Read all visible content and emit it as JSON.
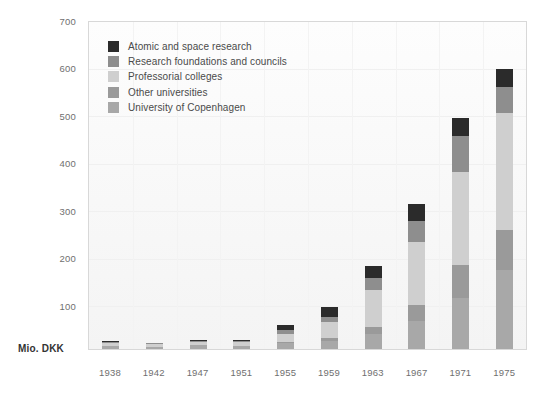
{
  "chart_data": {
    "type": "bar",
    "subtype": "stacked-bar",
    "title": "",
    "subtitle": "",
    "xlabel": "",
    "ylabel": "Mio. DKK",
    "ylim": [
      0,
      700
    ],
    "ytick_values": [
      100,
      200,
      300,
      400,
      500,
      600,
      700
    ],
    "ytick_labels": [
      "100",
      "200",
      "300",
      "400",
      "500",
      "600",
      "700"
    ],
    "grid": true,
    "legend_position": "inside-top-left",
    "categories": [
      "1938",
      "1942",
      "1947",
      "1951",
      "1955",
      "1959",
      "1963",
      "1967",
      "1971",
      "1975"
    ],
    "series": [
      {
        "name": "University of Copenhagen",
        "color": "#a8a8a8",
        "values": [
          7,
          5,
          8,
          7,
          12,
          18,
          33,
          60,
          110,
          170
        ]
      },
      {
        "name": "Other universities",
        "color": "#9a9a9a",
        "values": [
          0,
          0,
          0,
          0,
          4,
          6,
          14,
          35,
          70,
          85
        ]
      },
      {
        "name": "Professorial colleges",
        "color": "#cfcfcf",
        "values": [
          6,
          5,
          7,
          7,
          17,
          33,
          80,
          135,
          200,
          250
        ]
      },
      {
        "name": "Research foundations and councils",
        "color": "#8e8e8e",
        "values": [
          3,
          2,
          3,
          3,
          7,
          12,
          25,
          45,
          75,
          55
        ]
      },
      {
        "name": "Atomic and space research",
        "color": "#2b2b2b",
        "values": [
          2,
          1,
          2,
          2,
          12,
          22,
          25,
          35,
          40,
          40
        ]
      }
    ],
    "totals": [
      18,
      13,
      20,
      19,
      52,
      91,
      177,
      310,
      495,
      600
    ]
  },
  "legend": {
    "items": [
      {
        "label": "Atomic and space research",
        "color": "#2b2b2b"
      },
      {
        "label": "Research foundations and councils",
        "color": "#8e8e8e"
      },
      {
        "label": "Professorial colleges",
        "color": "#cfcfcf"
      },
      {
        "label": "Other universities",
        "color": "#9a9a9a"
      },
      {
        "label": "University of Copenhagen",
        "color": "#a8a8a8"
      }
    ]
  },
  "axis": {
    "y_unit_label": "Mio. DKK",
    "y_ticks": [
      "700",
      "600",
      "500",
      "400",
      "300",
      "200",
      "100"
    ],
    "x_ticks": [
      "1938",
      "1942",
      "1947",
      "1951",
      "1955",
      "1959",
      "1963",
      "1967",
      "1971",
      "1975"
    ]
  },
  "colors": {
    "plot_background": "#fbfbfb",
    "frame_border": "#d8d8d8",
    "gridline": "#f0f0f0",
    "tick_text": "#6f6f6f",
    "legend_text": "#4a4a4a",
    "unit_text": "#333333"
  }
}
